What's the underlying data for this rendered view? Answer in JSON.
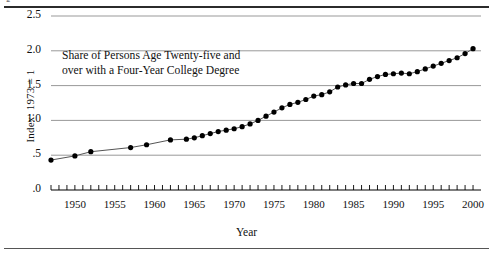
{
  "figure": {
    "caption_fragment": "g",
    "annotation_line1": "Share of Persons Age Twenty-five and",
    "annotation_line2": "over with a Four-Year College Degree"
  },
  "colors": {
    "line": "#555555",
    "marker": "#000000",
    "grid": "#999999",
    "axis": "#000000",
    "rule": "#2b2b2b",
    "background": "#ffffff"
  },
  "chart_data": {
    "type": "line",
    "title": "Share of Persons Age Twenty-five and over with a Four-Year College Degree",
    "xlabel": "Year",
    "ylabel": "Index: 1973 = 1",
    "xlim": [
      1947,
      2001
    ],
    "ylim": [
      0.0,
      2.5
    ],
    "grid": true,
    "legend": null,
    "ytick_labels": [
      ".0",
      ".5",
      "1.0",
      "1.5",
      "2.0",
      "2.5"
    ],
    "ytick_values": [
      0.0,
      0.5,
      1.0,
      1.5,
      2.0,
      2.5
    ],
    "xtick_labels": [
      "1950",
      "1955",
      "1960",
      "1965",
      "1970",
      "1975",
      "1980",
      "1985",
      "1990",
      "1995",
      "2000"
    ],
    "xtick_values": [
      1950,
      1955,
      1960,
      1965,
      1970,
      1975,
      1980,
      1985,
      1990,
      1995,
      2000
    ],
    "minor_xticks_every": 1,
    "marker": "circle",
    "series": [
      {
        "name": "Share of Persons Age Twenty-five and over with a Four-Year College Degree",
        "x": [
          1947,
          1950,
          1952,
          1957,
          1959,
          1962,
          1964,
          1965,
          1966,
          1967,
          1968,
          1969,
          1970,
          1971,
          1972,
          1973,
          1974,
          1975,
          1976,
          1977,
          1978,
          1979,
          1980,
          1981,
          1982,
          1983,
          1984,
          1985,
          1986,
          1987,
          1988,
          1989,
          1990,
          1991,
          1992,
          1993,
          1994,
          1995,
          1996,
          1997,
          1998,
          1999,
          2000
        ],
        "values": [
          0.43,
          0.49,
          0.55,
          0.61,
          0.65,
          0.72,
          0.73,
          0.75,
          0.78,
          0.81,
          0.84,
          0.86,
          0.88,
          0.91,
          0.95,
          1.0,
          1.06,
          1.12,
          1.18,
          1.23,
          1.26,
          1.3,
          1.35,
          1.37,
          1.41,
          1.48,
          1.51,
          1.53,
          1.53,
          1.59,
          1.63,
          1.66,
          1.67,
          1.68,
          1.67,
          1.7,
          1.74,
          1.78,
          1.82,
          1.86,
          1.9,
          1.96,
          2.03
        ]
      }
    ]
  }
}
